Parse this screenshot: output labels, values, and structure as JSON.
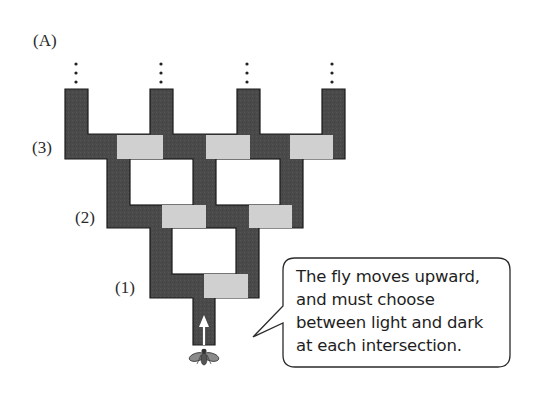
{
  "figure": {
    "panel_label": "(A)",
    "level_labels": [
      {
        "label": "(3)",
        "x": 32,
        "y": 139
      },
      {
        "label": "(2)",
        "x": 75,
        "y": 209
      },
      {
        "label": "(1)",
        "x": 115,
        "y": 279
      }
    ],
    "callout": {
      "lines": [
        "The fly moves upward,",
        "and must choose",
        "between light and dark",
        "at each intersection."
      ]
    },
    "continuation_marker": "⋮",
    "colors": {
      "dark_path": "#4a4a4a",
      "light_path": "#d0d0d0",
      "outline": "#1a1a1a",
      "background": "#ffffff",
      "arrow": "#ffffff",
      "fly": "#6a6a6a"
    },
    "maze": {
      "levels": 3,
      "exits_at_top": 4,
      "description": "Binary T-maze; at each intersection one branch is light and one is dark"
    }
  }
}
